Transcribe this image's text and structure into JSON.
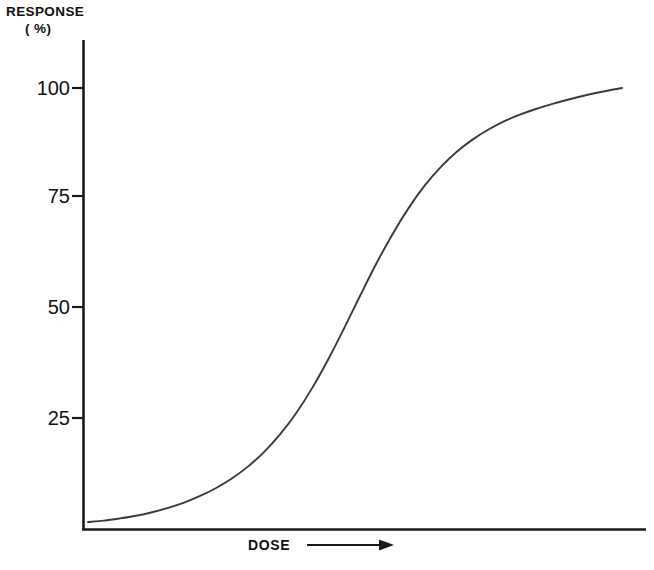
{
  "figure": {
    "background_color": "#ffffff",
    "ink_color": "#1a1a1a"
  },
  "labels": {
    "y_axis_title_line1": "RESPONSE",
    "y_axis_title_line2": "( %)",
    "x_axis_label": "DOSE",
    "x_axis_arrow": "arrow-right-icon"
  },
  "chart_data": {
    "type": "line",
    "title": "",
    "subtitle": "",
    "xlabel": "DOSE",
    "ylabel": "RESPONSE ( %)",
    "grid": false,
    "legend": null,
    "legend_position": "none",
    "xlim": [
      0,
      100
    ],
    "ylim": [
      0,
      105
    ],
    "x_tick_labels": [],
    "y_tick_labels": [
      "25",
      "50",
      "75",
      "100"
    ],
    "y_ticks": [
      25,
      50,
      75,
      100
    ],
    "annotations": [
      "Sigmoidal dose-response curve",
      "Arrow on x-axis indicates increasing dose"
    ],
    "series": [
      {
        "name": "Response",
        "x": [
          0,
          3,
          6,
          9,
          12,
          15,
          18,
          21,
          24,
          27,
          30,
          33,
          36,
          39,
          42,
          45,
          48,
          51,
          54,
          57,
          60,
          63,
          66,
          69,
          72,
          75,
          78,
          81,
          84,
          87,
          90,
          93,
          96,
          100
        ],
        "values": [
          1.6,
          1.9,
          2.4,
          3.0,
          3.8,
          4.8,
          6.0,
          7.5,
          9.3,
          11.5,
          14.2,
          17.5,
          21.5,
          26.3,
          32.0,
          38.5,
          45.6,
          53.0,
          60.2,
          66.8,
          72.7,
          77.8,
          82.0,
          85.5,
          88.3,
          90.6,
          92.5,
          94.0,
          95.3,
          96.4,
          97.4,
          98.3,
          99.1,
          100.0
        ]
      }
    ]
  }
}
